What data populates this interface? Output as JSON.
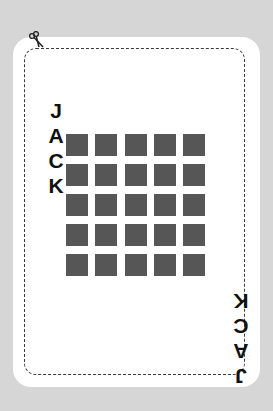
{
  "card": {
    "rank_name": "JACK",
    "letters_top": [
      "J",
      "A",
      "C",
      "K"
    ],
    "letters_bottom": [
      "J",
      "A",
      "C",
      "K"
    ],
    "grid": {
      "rows": 5,
      "cols": 5,
      "square_color": "#565656"
    },
    "cut_line_icon": "scissors-icon"
  },
  "colors": {
    "background": "#d6d6d6",
    "card": "#ffffff",
    "text": "#111111"
  }
}
